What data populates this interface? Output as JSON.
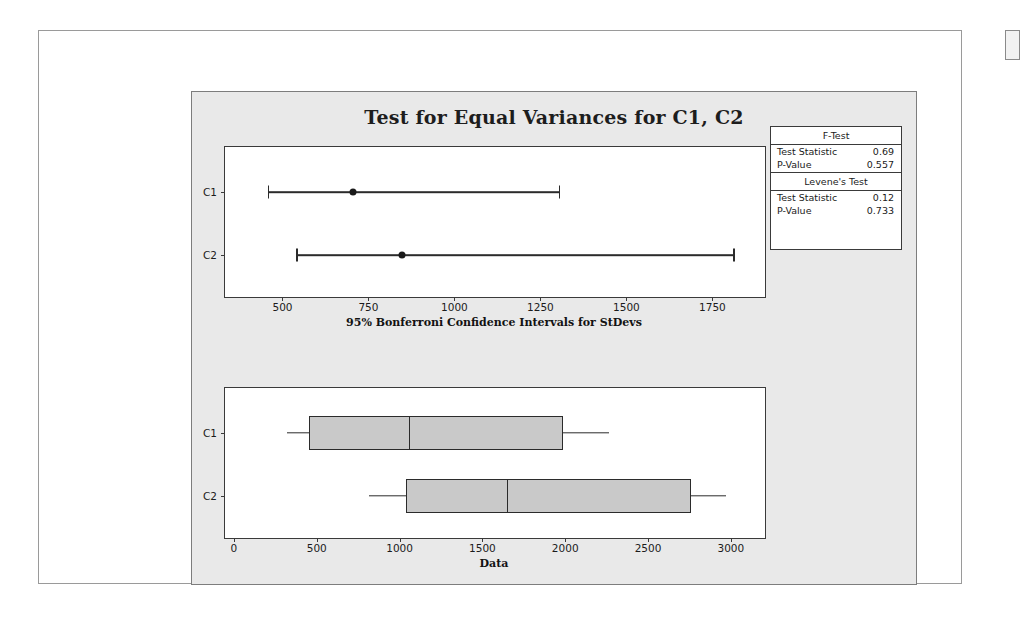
{
  "figure": {
    "title": "Test for Equal Variances for C1, C2"
  },
  "stats_table": {
    "sections": [
      {
        "heading": "F-Test",
        "rows": [
          {
            "label": "Test Statistic",
            "value": "0.69"
          },
          {
            "label": "P-Value",
            "value": "0.557"
          }
        ]
      },
      {
        "heading": "Levene's Test",
        "rows": [
          {
            "label": "Test Statistic",
            "value": "0.12"
          },
          {
            "label": "P-Value",
            "value": "0.733"
          }
        ]
      }
    ]
  },
  "chart_data": [
    {
      "type": "errorbar",
      "title": "95% Bonferroni Confidence Intervals for StDevs",
      "xlabel": "95% Bonferroni Confidence Intervals for StDevs",
      "ylabel": "",
      "categories": [
        "C1",
        "C2"
      ],
      "xticks": [
        500,
        750,
        1000,
        1250,
        1500,
        1750
      ],
      "xlim": [
        330,
        1900
      ],
      "grid": false,
      "series": [
        {
          "name": "C1",
          "lower": 454,
          "point": 702,
          "upper": 1300
        },
        {
          "name": "C2",
          "lower": 537,
          "point": 846,
          "upper": 1808
        }
      ]
    },
    {
      "type": "boxplot",
      "title": "Data",
      "xlabel": "Data",
      "ylabel": "",
      "categories": [
        "C1",
        "C2"
      ],
      "xticks": [
        0,
        500,
        1000,
        1500,
        2000,
        2500,
        3000
      ],
      "xlim": [
        -60,
        3200
      ],
      "grid": false,
      "boxes": [
        {
          "name": "C1",
          "whisker_low": 314,
          "q1": 449,
          "median": 1051,
          "q3": 1966,
          "whisker_high": 2259
        },
        {
          "name": "C2",
          "whisker_low": 812,
          "q1": 1030,
          "median": 1640,
          "q3": 2740,
          "whisker_high": 2962
        }
      ]
    }
  ],
  "colors": {
    "panel_bg": "#e9e9e9",
    "plot_bg": "#ffffff",
    "box_fill": "#c9c9c9",
    "ink": "#2b2b2b"
  }
}
